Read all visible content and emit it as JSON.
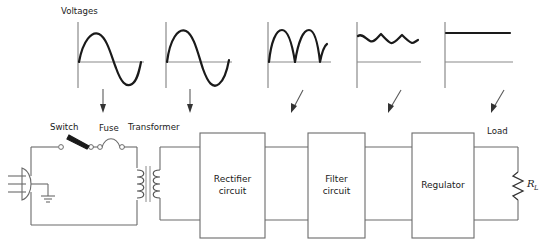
{
  "diagram": {
    "colors": {
      "wire": "#6b6b6b",
      "waveform": "#1a1a1a",
      "axis": "#8a8a8a",
      "text": "#1a1a1a",
      "background": "#ffffff"
    },
    "labels": {
      "voltages": "Voltages",
      "switch": "Switch",
      "fuse": "Fuse",
      "transformer": "Transformer",
      "load": "Load",
      "load_resistor": "R",
      "load_resistor_subscript": "L"
    },
    "blocks": [
      {
        "id": "rectifier",
        "line1": "Rectifier",
        "line2": "circuit"
      },
      {
        "id": "filter",
        "line1": "Filter",
        "line2": "circuit"
      },
      {
        "id": "regulator",
        "line1": "Regulator",
        "line2": ""
      }
    ],
    "waveforms": [
      {
        "id": "ac-line-input",
        "name": "sine-wave",
        "description": "full sine wave, one cycle"
      },
      {
        "id": "transformer-secondary",
        "name": "sine-wave",
        "description": "full sine wave, one cycle"
      },
      {
        "id": "rectifier-output",
        "name": "full-wave-rectified",
        "description": "two positive humps"
      },
      {
        "id": "filter-output",
        "name": "ripple-dc",
        "description": "near-flat line with ripple near top"
      },
      {
        "id": "regulator-output",
        "name": "flat-dc",
        "description": "flat straight DC line"
      }
    ],
    "arrows": [
      {
        "id": "arrow-1",
        "direction": "down"
      },
      {
        "id": "arrow-2",
        "direction": "down"
      },
      {
        "id": "arrow-3",
        "direction": "down-left"
      },
      {
        "id": "arrow-4",
        "direction": "down-left"
      },
      {
        "id": "arrow-5",
        "direction": "down-left"
      }
    ]
  }
}
